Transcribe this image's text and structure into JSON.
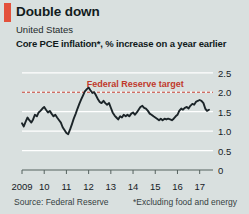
{
  "header": {
    "title": "Double down",
    "country": "United States",
    "measure": "Core PCE inflation*, % increase on a year earlier",
    "accent_color": "#e3513c"
  },
  "footer": {
    "source": "Source: Federal Reserve",
    "footnote": "*Excluding food and energy"
  },
  "chart_data": {
    "type": "line",
    "title": "Double down",
    "subtitle": "United States",
    "ylabel": "Core PCE inflation*, % increase on a year earlier",
    "xlabel": "",
    "grid": true,
    "legend": "none",
    "line_color": "#1b2428",
    "background": "#d9e0df",
    "gridline_color": "#ffffff",
    "ylim": [
      0,
      2.7
    ],
    "yticks": [
      0,
      0.5,
      1.0,
      1.5,
      2.0,
      2.5
    ],
    "ytick_labels": [
      "0",
      "0.5",
      "1.0",
      "1.5",
      "2.0",
      "2.5"
    ],
    "xlim": [
      2009.0,
      2017.6
    ],
    "xticks": [
      2009,
      2010,
      2011,
      2012,
      2013,
      2014,
      2015,
      2016,
      2017
    ],
    "xtick_labels": [
      "2009",
      "10",
      "11",
      "12",
      "13",
      "14",
      "15",
      "16",
      "17"
    ],
    "annotations": [
      {
        "name": "fed-target",
        "label": "Federal Reserve target",
        "type": "hline",
        "value": 2.0,
        "color": "#c0392b",
        "style": "dashed",
        "label_x": 2014.1,
        "label_y": 2.17
      }
    ],
    "series": [
      {
        "name": "Core PCE inflation",
        "color": "#1b2428",
        "x": [
          2009.0,
          2009.08,
          2009.17,
          2009.25,
          2009.33,
          2009.42,
          2009.5,
          2009.58,
          2009.67,
          2009.75,
          2009.83,
          2009.92,
          2010.0,
          2010.08,
          2010.17,
          2010.25,
          2010.33,
          2010.42,
          2010.5,
          2010.58,
          2010.67,
          2010.75,
          2010.83,
          2010.92,
          2011.0,
          2011.08,
          2011.17,
          2011.25,
          2011.33,
          2011.42,
          2011.5,
          2011.58,
          2011.67,
          2011.75,
          2011.83,
          2011.92,
          2012.0,
          2012.08,
          2012.17,
          2012.25,
          2012.33,
          2012.42,
          2012.5,
          2012.58,
          2012.67,
          2012.75,
          2012.83,
          2012.92,
          2013.0,
          2013.08,
          2013.17,
          2013.25,
          2013.33,
          2013.42,
          2013.5,
          2013.58,
          2013.67,
          2013.75,
          2013.83,
          2013.92,
          2014.0,
          2014.08,
          2014.17,
          2014.25,
          2014.33,
          2014.42,
          2014.5,
          2014.58,
          2014.67,
          2014.75,
          2014.83,
          2014.92,
          2015.0,
          2015.08,
          2015.17,
          2015.25,
          2015.33,
          2015.42,
          2015.5,
          2015.58,
          2015.67,
          2015.75,
          2015.83,
          2015.92,
          2016.0,
          2016.08,
          2016.17,
          2016.25,
          2016.33,
          2016.42,
          2016.5,
          2016.58,
          2016.67,
          2016.75,
          2016.83,
          2016.92,
          2017.0,
          2017.08,
          2017.17,
          2017.25,
          2017.33,
          2017.42
        ],
        "values": [
          1.2,
          1.12,
          1.25,
          1.35,
          1.28,
          1.22,
          1.3,
          1.42,
          1.38,
          1.48,
          1.52,
          1.58,
          1.62,
          1.55,
          1.48,
          1.52,
          1.45,
          1.38,
          1.42,
          1.35,
          1.28,
          1.22,
          1.1,
          1.02,
          0.95,
          0.92,
          1.05,
          1.18,
          1.32,
          1.45,
          1.58,
          1.7,
          1.82,
          1.92,
          2.02,
          2.08,
          2.12,
          2.05,
          1.98,
          2.0,
          1.92,
          1.82,
          1.75,
          1.72,
          1.78,
          1.72,
          1.68,
          1.72,
          1.6,
          1.48,
          1.4,
          1.35,
          1.3,
          1.38,
          1.35,
          1.42,
          1.38,
          1.42,
          1.38,
          1.45,
          1.48,
          1.42,
          1.48,
          1.55,
          1.62,
          1.65,
          1.6,
          1.58,
          1.52,
          1.45,
          1.42,
          1.38,
          1.35,
          1.32,
          1.28,
          1.32,
          1.28,
          1.32,
          1.3,
          1.32,
          1.3,
          1.28,
          1.32,
          1.38,
          1.42,
          1.52,
          1.58,
          1.55,
          1.6,
          1.62,
          1.58,
          1.65,
          1.7,
          1.68,
          1.75,
          1.78,
          1.8,
          1.78,
          1.72,
          1.58,
          1.52,
          1.55
        ]
      }
    ]
  }
}
